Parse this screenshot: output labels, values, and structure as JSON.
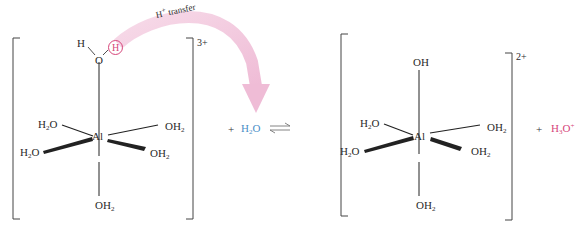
{
  "diagram": {
    "arrow_label": "H+ transfer",
    "arrow_label_base": "H",
    "arrow_label_sup": "+",
    "arrow_label_rest": " transfer",
    "colors": {
      "arrow": "#f2c6dd",
      "transferred_proton": "#d6467a",
      "water_reactant": "#4a8fc8",
      "hydronium_product": "#d6467a",
      "bonds": "#222222"
    },
    "reactant_complex": {
      "metal": "Al",
      "charge": "3+",
      "top_ligand": {
        "h_left": "H",
        "o": "O",
        "h_circled": "H"
      },
      "ligands": {
        "upper_left": {
          "base": "H",
          "sub": "2",
          "rest": "O"
        },
        "upper_right": {
          "base": "OH",
          "sub": "2"
        },
        "lower_left": {
          "base": "H",
          "sub": "2",
          "rest": "O"
        },
        "lower_right": {
          "base": "OH",
          "sub": "2"
        },
        "bottom": {
          "base": "OH",
          "sub": "2"
        }
      }
    },
    "plus_1": "+",
    "water": {
      "base": "H",
      "sub": "2",
      "rest": "O"
    },
    "equilibrium_arrow": "⇌",
    "product_complex": {
      "metal": "Al",
      "charge": "2+",
      "ligands": {
        "top": "OH",
        "upper_left": {
          "base": "H",
          "sub": "2",
          "rest": "O"
        },
        "upper_right": {
          "base": "OH",
          "sub": "2"
        },
        "lower_left": {
          "base": "H",
          "sub": "2",
          "rest": "O"
        },
        "lower_right": {
          "base": "OH",
          "sub": "2"
        },
        "bottom": {
          "base": "OH",
          "sub": "2"
        }
      }
    },
    "plus_2": "+",
    "hydronium": {
      "base": "H",
      "sub": "3",
      "rest": "O",
      "sup": "+"
    }
  }
}
